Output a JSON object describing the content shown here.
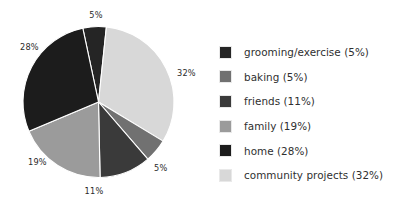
{
  "chart_data": {
    "type": "pie",
    "title": "",
    "labels": [
      "grooming/exercise",
      "baking",
      "friends",
      "family",
      "home",
      "community projects"
    ],
    "values": [
      5,
      5,
      11,
      19,
      28,
      32
    ],
    "value_unit": "%",
    "slice_labels": [
      "5%",
      "5%",
      "11%",
      "19%",
      "28%",
      "32%"
    ],
    "colors": [
      "#252525",
      "#717171",
      "#3a3a3a",
      "#9b9b9b",
      "#1c1c1c",
      "#d8d8d8"
    ],
    "legend_position": "right",
    "grid": false,
    "draw_order_clockwise_from_top": [
      {
        "label": "grooming/exercise",
        "value": 5,
        "color": "#252525",
        "start_deg": -12,
        "sweep_deg": 18
      },
      {
        "label": "community projects",
        "value": 32,
        "color": "#d8d8d8",
        "start_deg": 6,
        "sweep_deg": 115.2
      },
      {
        "label": "baking",
        "value": 5,
        "color": "#717171",
        "start_deg": 121.2,
        "sweep_deg": 18
      },
      {
        "label": "friends",
        "value": 11,
        "color": "#3a3a3a",
        "start_deg": 139.2,
        "sweep_deg": 39.6
      },
      {
        "label": "family",
        "value": 19,
        "color": "#9b9b9b",
        "start_deg": 178.8,
        "sweep_deg": 68.4
      },
      {
        "label": "home",
        "value": 28,
        "color": "#1c1c1c",
        "start_deg": 247.2,
        "sweep_deg": 100.8
      }
    ],
    "slice_label_positions": [
      {
        "text": "5%",
        "x": 96,
        "y": 10,
        "anchor": "middle"
      },
      {
        "text": "32%",
        "x": 177,
        "y": 68,
        "anchor": "start"
      },
      {
        "text": "5%",
        "x": 154,
        "y": 163,
        "anchor": "start"
      },
      {
        "text": "11%",
        "x": 94,
        "y": 186,
        "anchor": "middle"
      },
      {
        "text": "19%",
        "x": 28,
        "y": 157,
        "anchor": "start"
      },
      {
        "text": "28%",
        "x": 20,
        "y": 42,
        "anchor": "start"
      }
    ],
    "background_color": "#ffffff",
    "separator_color": "#ffffff"
  },
  "legend": {
    "entries": [
      {
        "label": "grooming/exercise (5%)",
        "color": "#252525",
        "icon": "legend-swatch"
      },
      {
        "label": "baking (5%)",
        "color": "#717171",
        "icon": "legend-swatch"
      },
      {
        "label": "friends (11%)",
        "color": "#3a3a3a",
        "icon": "legend-swatch"
      },
      {
        "label": "family (19%)",
        "color": "#9b9b9b",
        "icon": "legend-swatch"
      },
      {
        "label": "home (28%)",
        "color": "#1c1c1c",
        "icon": "legend-swatch"
      },
      {
        "label": "community projects (32%)",
        "color": "#d8d8d8",
        "icon": "legend-swatch"
      }
    ]
  }
}
